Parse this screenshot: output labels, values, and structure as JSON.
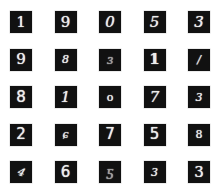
{
  "grid": {
    "rows": 5,
    "cols": 5,
    "cells": [
      {
        "label": "1",
        "glyph": "1"
      },
      {
        "label": "9",
        "glyph": "9"
      },
      {
        "label": "0",
        "glyph": "0"
      },
      {
        "label": "5",
        "glyph": "5"
      },
      {
        "label": "3",
        "glyph": "3"
      },
      {
        "label": "9",
        "glyph": "9"
      },
      {
        "label": "8",
        "glyph": "8"
      },
      {
        "label": "3",
        "glyph": "ɜ"
      },
      {
        "label": "1",
        "glyph": "1"
      },
      {
        "label": "1",
        "glyph": "/"
      },
      {
        "label": "8",
        "glyph": "8"
      },
      {
        "label": "1",
        "glyph": "1"
      },
      {
        "label": "0",
        "glyph": "o"
      },
      {
        "label": "7",
        "glyph": "7"
      },
      {
        "label": "3",
        "glyph": "3"
      },
      {
        "label": "2",
        "glyph": "2"
      },
      {
        "label": "6",
        "glyph": "ɕ"
      },
      {
        "label": "7",
        "glyph": "7"
      },
      {
        "label": "5",
        "glyph": "5"
      },
      {
        "label": "8",
        "glyph": "8"
      },
      {
        "label": "9",
        "glyph": "4"
      },
      {
        "label": "6",
        "glyph": "6"
      },
      {
        "label": "5",
        "glyph": "ƽ"
      },
      {
        "label": "3",
        "glyph": "3"
      },
      {
        "label": "3",
        "glyph": "3"
      }
    ]
  }
}
